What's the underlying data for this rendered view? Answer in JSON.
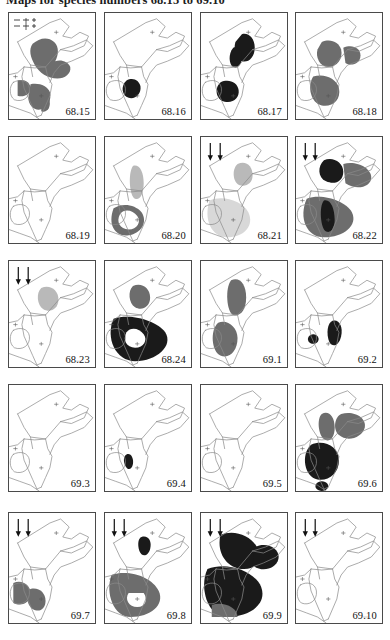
{
  "page": {
    "title": "Maps for species numbers 68.15 to 69.10",
    "layout": {
      "rows": 5,
      "cols": 4,
      "panel_count": 20
    },
    "region": "Horn of Africa and East Africa",
    "colors": {
      "outline": "#8a8a8a",
      "border": "#4a4a4a",
      "fill_dark": "#1a1a1a",
      "fill_mid": "#6d6d6d",
      "fill_light": "#b9b9b9",
      "fill_pale": "#d8d8d8",
      "background": "#ffffff",
      "text": "#111111"
    },
    "legend": {
      "present_in_first_panel": true,
      "rows": [
        {
          "symbol": "dashed-line",
          "marker": "cross"
        },
        {
          "symbol": "dashed-line",
          "marker": "cross"
        }
      ]
    }
  },
  "panels": [
    {
      "id": "p1",
      "label": "68.15",
      "row": 1,
      "col": 1,
      "arrows": 0,
      "legend": true,
      "shapes": [
        {
          "name": "ethiopia-highlands",
          "tone": "mid",
          "d": "M22,32 C28,26 36,24 42,30 C47,35 46,44 43,50 C48,48 55,50 57,56 C58,63 52,68 45,68 C36,68 28,62 24,54 C20,46 18,38 22,32 Z"
        },
        {
          "name": "lake-victoria-block",
          "tone": "mid",
          "d": "M8,70 C14,68 20,72 20,78 C20,84 14,88 8,86 Z"
        },
        {
          "name": "tanzania-band",
          "tone": "mid",
          "d": "M20,74 C28,72 36,76 38,82 C40,90 36,98 30,100 C24,102 18,96 18,88 Z"
        },
        {
          "name": "coastal-strip",
          "tone": "mid",
          "d": "M30,84 C34,82 38,86 38,94 C38,100 34,104 30,102 Z"
        }
      ]
    },
    {
      "id": "p2",
      "label": "68.16",
      "row": 1,
      "col": 2,
      "arrows": 0,
      "legend": false,
      "shapes": [
        {
          "name": "south-sudan-patch",
          "tone": "dark",
          "d": "M20,70 C26,66 32,70 33,76 C34,84 28,90 22,88 C16,86 14,76 20,70 Z"
        }
      ]
    },
    {
      "id": "p3",
      "label": "68.17",
      "row": 1,
      "col": 3,
      "arrows": 0,
      "legend": false,
      "shapes": [
        {
          "name": "ethiopia-east",
          "tone": "dark",
          "d": "M38,22 C44,20 50,26 50,36 C50,46 44,52 38,50 C32,48 30,38 32,30 Z"
        },
        {
          "name": "rift-patch",
          "tone": "dark",
          "d": "M30,36 C34,34 38,38 38,46 C38,54 34,58 30,56 C26,54 25,42 30,36 Z"
        },
        {
          "name": "victoria-basin",
          "tone": "dark",
          "d": "M18,72 C26,68 34,72 35,80 C36,88 30,94 22,92 C14,90 12,78 18,72 Z"
        }
      ]
    },
    {
      "id": "p4",
      "label": "68.18",
      "row": 1,
      "col": 4,
      "arrows": 0,
      "legend": false,
      "shapes": [
        {
          "name": "ethiopia-core",
          "tone": "mid",
          "d": "M24,30 C32,26 40,30 42,38 C44,48 38,56 30,56 C22,56 18,46 20,38 Z"
        },
        {
          "name": "somali-arm",
          "tone": "mid",
          "d": "M44,36 C52,32 60,36 60,44 C60,52 52,56 46,52 Z"
        },
        {
          "name": "kenya-block",
          "tone": "mid",
          "d": "M16,66 C26,62 38,68 40,78 C42,90 34,98 24,96 C14,94 10,76 16,66 Z"
        }
      ]
    },
    {
      "id": "p5",
      "label": "68.19",
      "row": 2,
      "col": 1,
      "arrows": 0,
      "legend": false,
      "shapes": []
    },
    {
      "id": "p6",
      "label": "68.20",
      "row": 2,
      "col": 2,
      "arrows": 0,
      "legend": false,
      "shapes": [
        {
          "name": "rift-valley-strip",
          "tone": "light",
          "d": "M26,30 C32,28 36,36 36,48 C36,60 32,66 28,64 C23,62 21,38 26,30 Z"
        },
        {
          "name": "victoria-ring",
          "tone": "mid",
          "d": "M8,74 C16,68 28,70 34,78 C40,88 34,100 22,102 C10,104 2,92 8,74 Z M14,80 C10,88 14,96 22,96 C30,96 34,88 30,82 C26,76 18,74 14,80 Z"
        }
      ]
    },
    {
      "id": "p7",
      "label": "68.21",
      "row": 2,
      "col": 3,
      "arrows": 2,
      "legend": false,
      "shapes": [
        {
          "name": "ethiopia-patch",
          "tone": "light",
          "d": "M34,28 C42,24 48,30 48,40 C48,48 42,52 36,50 C30,48 28,34 34,28 Z"
        },
        {
          "name": "kenya-broad",
          "tone": "pale",
          "d": "M8,66 C20,60 38,66 44,78 C50,92 40,104 24,104 C10,104 2,86 8,66 Z"
        }
      ]
    },
    {
      "id": "p8",
      "label": "68.22",
      "row": 2,
      "col": 4,
      "arrows": 2,
      "legend": false,
      "shapes": [
        {
          "name": "ethiopia-dark",
          "tone": "dark",
          "d": "M26,24 C34,20 44,26 44,36 C44,46 36,50 28,46 C20,42 20,30 26,24 Z"
        },
        {
          "name": "somali-wing",
          "tone": "mid",
          "d": "M44,28 C56,24 70,32 70,42 C70,52 56,56 46,48 Z"
        },
        {
          "name": "kenya-dark",
          "tone": "mid",
          "d": "M10,64 C24,58 46,66 52,78 C58,92 44,104 26,104 C10,104 2,84 10,64 Z"
        },
        {
          "name": "rift-black",
          "tone": "dark",
          "d": "M26,66 C32,64 36,74 36,86 C36,96 32,100 28,98 C23,96 21,72 26,66 Z"
        }
      ]
    },
    {
      "id": "p9",
      "label": "68.23",
      "row": 3,
      "col": 1,
      "arrows": 2,
      "legend": false,
      "shapes": [
        {
          "name": "ethiopia-pale",
          "tone": "light",
          "d": "M30,28 C38,24 46,30 46,40 C46,50 38,54 32,50 C26,46 25,33 30,28 Z"
        }
      ]
    },
    {
      "id": "p10",
      "label": "68.24",
      "row": 3,
      "col": 2,
      "arrows": 0,
      "legend": false,
      "shapes": [
        {
          "name": "ethiopia-grey",
          "tone": "mid",
          "d": "M26,26 C34,22 42,28 42,38 C42,48 34,52 28,48 C22,44 21,31 26,26 Z"
        },
        {
          "name": "kenya-black",
          "tone": "dark",
          "d": "M8,60 C24,54 48,62 56,74 C64,88 48,104 28,104 C10,104 0,80 8,60 Z"
        },
        {
          "name": "inner-hole",
          "tone": "white",
          "d": "M20,74 C16,82 20,90 28,90 C36,90 40,82 36,76 C32,70 24,68 20,74 Z"
        }
      ]
    },
    {
      "id": "p11",
      "label": "69.1",
      "row": 3,
      "col": 3,
      "arrows": 0,
      "legend": false,
      "shapes": [
        {
          "name": "ethiopia-column",
          "tone": "mid",
          "d": "M28,20 C36,16 42,24 42,38 C42,52 36,58 30,56 C24,54 22,28 28,20 Z"
        },
        {
          "name": "kenya-band",
          "tone": "mid",
          "d": "M16,64 C24,60 34,68 34,80 C34,94 26,102 18,98 C10,94 8,72 16,64 Z"
        }
      ]
    },
    {
      "id": "p12",
      "label": "69.2",
      "row": 3,
      "col": 4,
      "arrows": 0,
      "legend": false,
      "shapes": [
        {
          "name": "spot-west",
          "tone": "dark",
          "d": "M16,76 a5,5 0 1,0 .1,0 Z"
        },
        {
          "name": "spot-central",
          "tone": "dark",
          "d": "M34,62 C40,60 44,68 42,78 C40,88 34,90 31,84 C28,76 29,64 34,62 Z"
        }
      ]
    },
    {
      "id": "p13",
      "label": "69.3",
      "row": 4,
      "col": 1,
      "arrows": 0,
      "legend": false,
      "shapes": []
    },
    {
      "id": "p14",
      "label": "69.4",
      "row": 4,
      "col": 2,
      "arrows": 0,
      "legend": false,
      "shapes": [
        {
          "name": "small-spot",
          "tone": "dark",
          "d": "M20,72 C24,70 27,76 26,82 C25,88 21,89 19,84 C17,79 17,74 20,72 Z"
        }
      ]
    },
    {
      "id": "p15",
      "label": "69.5",
      "row": 4,
      "col": 3,
      "arrows": 0,
      "legend": false,
      "shapes": []
    },
    {
      "id": "p16",
      "label": "69.6",
      "row": 4,
      "col": 4,
      "arrows": 0,
      "legend": false,
      "shapes": [
        {
          "name": "ethiopia-wing-w",
          "tone": "mid",
          "d": "M24,30 C30,26 36,32 36,44 C36,56 30,60 26,56 C21,52 19,35 24,30 Z"
        },
        {
          "name": "ethiopia-wing-e",
          "tone": "mid",
          "d": "M42,30 C54,26 66,34 64,44 C62,54 48,60 40,52 C34,46 36,33 42,30 Z"
        },
        {
          "name": "kenya-black-mass",
          "tone": "dark",
          "d": "M14,62 C26,56 40,64 40,78 C40,92 30,100 20,98 C8,96 4,72 14,62 Z"
        },
        {
          "name": "south-spot",
          "tone": "dark",
          "d": "M24,100 a6,5 0 1,0 .1,0 Z"
        }
      ]
    },
    {
      "id": "p17",
      "label": "69.7",
      "row": 5,
      "col": 1,
      "arrows": 2,
      "legend": false,
      "shapes": [
        {
          "name": "victoria-grey",
          "tone": "mid",
          "d": "M4,70 C12,66 20,72 20,80 C20,90 12,94 4,90 Z"
        },
        {
          "name": "tanzania-grey",
          "tone": "mid",
          "d": "M20,76 C28,74 34,80 34,88 C34,96 28,100 22,96 C16,92 15,78 20,76 Z"
        }
      ]
    },
    {
      "id": "p18",
      "label": "69.8",
      "row": 5,
      "col": 2,
      "arrows": 2,
      "legend": false,
      "shapes": [
        {
          "name": "ethiopia-spot",
          "tone": "dark",
          "d": "M34,24 C40,22 44,28 42,36 C40,44 34,44 32,38 C30,31 31,25 34,24 Z"
        },
        {
          "name": "kenya-grey-mass",
          "tone": "mid",
          "d": "M6,62 C22,56 44,64 50,78 C56,92 42,104 24,104 C8,104 0,80 6,62 Z"
        },
        {
          "name": "hole-white",
          "tone": "white",
          "d": "M22,80 C18,86 22,94 30,94 C38,94 40,86 36,80 Z"
        }
      ]
    },
    {
      "id": "p19",
      "label": "69.9",
      "row": 5,
      "col": 3,
      "arrows": 2,
      "legend": false,
      "shapes": [
        {
          "name": "ethiopia-black",
          "tone": "dark",
          "d": "M18,22 C30,16 46,22 52,34 C58,46 52,56 40,56 C26,56 14,42 18,22 Z"
        },
        {
          "name": "somali-black",
          "tone": "dark",
          "d": "M50,34 C62,28 74,36 72,46 C70,56 56,60 48,52 Z"
        },
        {
          "name": "kenya-black",
          "tone": "dark",
          "d": "M6,56 C24,48 50,58 56,74 C62,92 44,104 24,104 C6,104 -2,74 6,56 Z"
        },
        {
          "name": "tanzania-grey",
          "tone": "mid",
          "d": "M10,92 C20,88 34,94 34,104 L10,104 Z"
        }
      ]
    },
    {
      "id": "p20",
      "label": "69.10",
      "row": 5,
      "col": 4,
      "arrows": 2,
      "legend": false,
      "shapes": []
    }
  ]
}
